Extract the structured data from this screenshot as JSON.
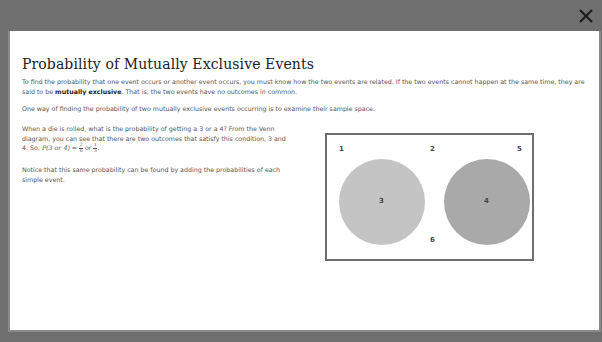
{
  "modal": {
    "close_label": "×",
    "title": "Probability of Mutually Exclusive Events",
    "intro": {
      "text_before": "To find the probability that one event occurs or another event occurs, you must know how the two events are related. If the two events cannot happen at the same time, they are said to be ",
      "bold_term": "mutually exclusive",
      "text_after": ". That is, the two events have no outcomes in common."
    },
    "sample_space_sentence": "One way of finding the probability of two mutually exclusive events occurring is to examine their sample space.",
    "example": {
      "text": "When a die is rolled, what is the probability of getting a 3 or a 4? From the Venn diagram, you can see that there are two outcomes that satisfy this condition, 3 and 4. So, ",
      "expression": "P(3 or 4) = ",
      "fraction_1": {
        "numerator": "2",
        "denominator": "6"
      },
      "conjunction": " or ",
      "fraction_2": {
        "numerator": "1",
        "denominator": "3"
      },
      "end": "."
    },
    "note": "Notice that this same probability can be found by adding the probabilities of each simple event."
  },
  "venn_diagram": {
    "outside_outcomes": [
      "1",
      "2",
      "5",
      "6"
    ],
    "circles": [
      {
        "label": "3",
        "color": "#c4c4c4"
      },
      {
        "label": "4",
        "color": "#a9a9a9"
      }
    ],
    "border_color": "#6e6e6e"
  }
}
